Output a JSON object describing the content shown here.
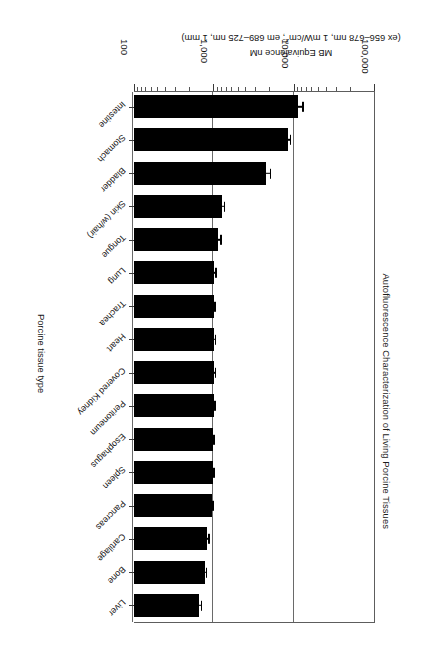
{
  "chart_data": {
    "type": "bar",
    "orientation": "horizontal",
    "title": "Autofluorescence Characterization of Living Porcine Tissues",
    "xlabel": "Porcine tissue type",
    "ylabel_line1": "MB Equivalence nM",
    "ylabel_line2": "(ex 656–678 nm, 1 mW/cm²; em 689–725 nm, 1 mm)",
    "ylabel_full": "MB Equivalence nM (ex 656–678 nm, 1 mW/cm²; em 689–725 nm, 1 mm)",
    "scale": "log",
    "ylim": [
      100,
      100000
    ],
    "tick_labels": [
      "100,000",
      "10,000",
      "1,000",
      "100"
    ],
    "tick_values": [
      100000,
      10000,
      1000,
      100
    ],
    "grid": true,
    "legend": null,
    "categories": [
      "Intestine",
      "Stomach",
      "Bladder",
      "Skin (w/hair)",
      "Tongue",
      "Lung",
      "Trachea",
      "Heart",
      "Covered Kidney",
      "Peritoneum",
      "Esophagus",
      "Spleen",
      "Pancreas",
      "Cartilage",
      "Bone",
      "Liver"
    ],
    "values": [
      11000,
      8200,
      4400,
      1250,
      1120,
      1000,
      980,
      1000,
      1000,
      980,
      960,
      960,
      930,
      820,
      760,
      650
    ],
    "errors": [
      1900,
      900,
      700,
      120,
      110,
      70,
      60,
      60,
      60,
      60,
      60,
      60,
      60,
      60,
      60,
      60
    ],
    "series": [
      {
        "name": "MB Equivalence nM",
        "points": [
          {
            "category": "Intestine",
            "value": 11000,
            "error": 1900
          },
          {
            "category": "Stomach",
            "value": 8200,
            "error": 900
          },
          {
            "category": "Bladder",
            "value": 4400,
            "error": 700
          },
          {
            "category": "Skin (w/hair)",
            "value": 1250,
            "error": 120
          },
          {
            "category": "Tongue",
            "value": 1120,
            "error": 110
          },
          {
            "category": "Lung",
            "value": 1000,
            "error": 70
          },
          {
            "category": "Trachea",
            "value": 980,
            "error": 60
          },
          {
            "category": "Heart",
            "value": 1000,
            "error": 60
          },
          {
            "category": "Covered Kidney",
            "value": 1000,
            "error": 60
          },
          {
            "category": "Peritoneum",
            "value": 980,
            "error": 60
          },
          {
            "category": "Esophagus",
            "value": 960,
            "error": 60
          },
          {
            "category": "Spleen",
            "value": 960,
            "error": 60
          },
          {
            "category": "Pancreas",
            "value": 930,
            "error": 60
          },
          {
            "category": "Cartilage",
            "value": 820,
            "error": 60
          },
          {
            "category": "Bone",
            "value": 760,
            "error": 60
          },
          {
            "category": "Liver",
            "value": 650,
            "error": 60
          }
        ]
      }
    ],
    "colors": {
      "bar": "#000000",
      "axis": "#5d5d5d",
      "grid": "#6a6a6a",
      "text": "#121212",
      "background": "#ffffff"
    }
  }
}
